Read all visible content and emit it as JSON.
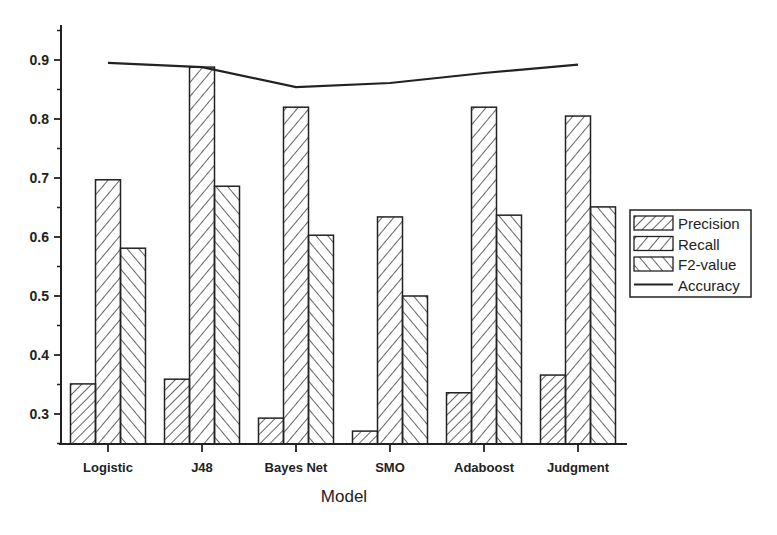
{
  "chart_data": {
    "type": "bar",
    "title": "",
    "xlabel": "Model",
    "ylabel": "",
    "categories": [
      "Logistic",
      "J48",
      "Bayes Net",
      "SMO",
      "Adaboost",
      "Judgment"
    ],
    "series": [
      {
        "name": "Precision",
        "type": "bar",
        "pattern": "hatch-fwd-dense",
        "values": [
          0.351,
          0.359,
          0.293,
          0.271,
          0.336,
          0.366
        ]
      },
      {
        "name": "Recall",
        "type": "bar",
        "pattern": "hatch-fwd",
        "values": [
          0.697,
          0.888,
          0.82,
          0.634,
          0.82,
          0.805
        ]
      },
      {
        "name": "F2-value",
        "type": "bar",
        "pattern": "hatch-back",
        "values": [
          0.581,
          0.686,
          0.603,
          0.5,
          0.637,
          0.651
        ]
      },
      {
        "name": "Accuracy",
        "type": "line",
        "values": [
          0.895,
          0.888,
          0.854,
          0.861,
          0.878,
          0.892
        ]
      }
    ],
    "ylim": [
      0.25,
      0.96
    ],
    "yticks": [
      0.3,
      0.4,
      0.5,
      0.6,
      0.7,
      0.8,
      0.9
    ],
    "ytick_labels": [
      "0.3",
      "0.4",
      "0.5",
      "0.6",
      "0.7",
      "0.8",
      "0.9"
    ],
    "grid": false,
    "legend_position": "right",
    "colors": {
      "ink": "#222222",
      "background": "#ffffff"
    }
  }
}
